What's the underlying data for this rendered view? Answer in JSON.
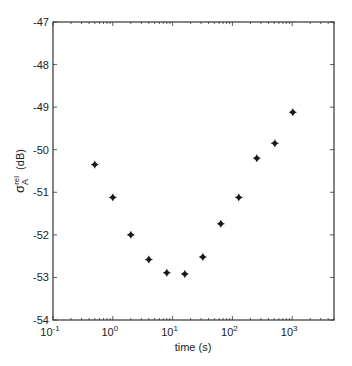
{
  "chart_data": {
    "type": "scatter",
    "title": "",
    "xlabel": "time (s)",
    "ylabel": "σ_A^rel (dB)",
    "ylabel_parts": {
      "base": "σ",
      "sup": "rel",
      "sub": "A",
      "unit": "(dB)"
    },
    "xscale": "log",
    "xlim": [
      0.1,
      5000
    ],
    "ylim": [
      -54,
      -47
    ],
    "grid": false,
    "legend": null,
    "xticks": [
      0.1,
      1,
      10,
      100,
      1000
    ],
    "xtick_labels": [
      {
        "base": "10",
        "exp": "-1"
      },
      {
        "base": "10",
        "exp": "0"
      },
      {
        "base": "10",
        "exp": "1"
      },
      {
        "base": "10",
        "exp": "2"
      },
      {
        "base": "10",
        "exp": "3"
      }
    ],
    "yticks": [
      -47,
      -48,
      -49,
      -50,
      -51,
      -52,
      -53,
      -54
    ],
    "ytick_labels": [
      "-47",
      "-48",
      "-49",
      "-50",
      "-51",
      "-52",
      "-53",
      "-54"
    ],
    "marker": "diamond",
    "marker_color": "#1a1a1a",
    "series": [
      {
        "name": "σ_A^rel",
        "x": [
          0.5,
          1,
          2,
          4,
          8,
          16,
          32,
          64,
          128,
          256,
          512,
          1024
        ],
        "values": [
          -50.35,
          -51.12,
          -52.0,
          -52.58,
          -52.89,
          -52.92,
          -52.52,
          -51.74,
          -51.12,
          -50.2,
          -49.85,
          -49.12
        ]
      }
    ]
  }
}
